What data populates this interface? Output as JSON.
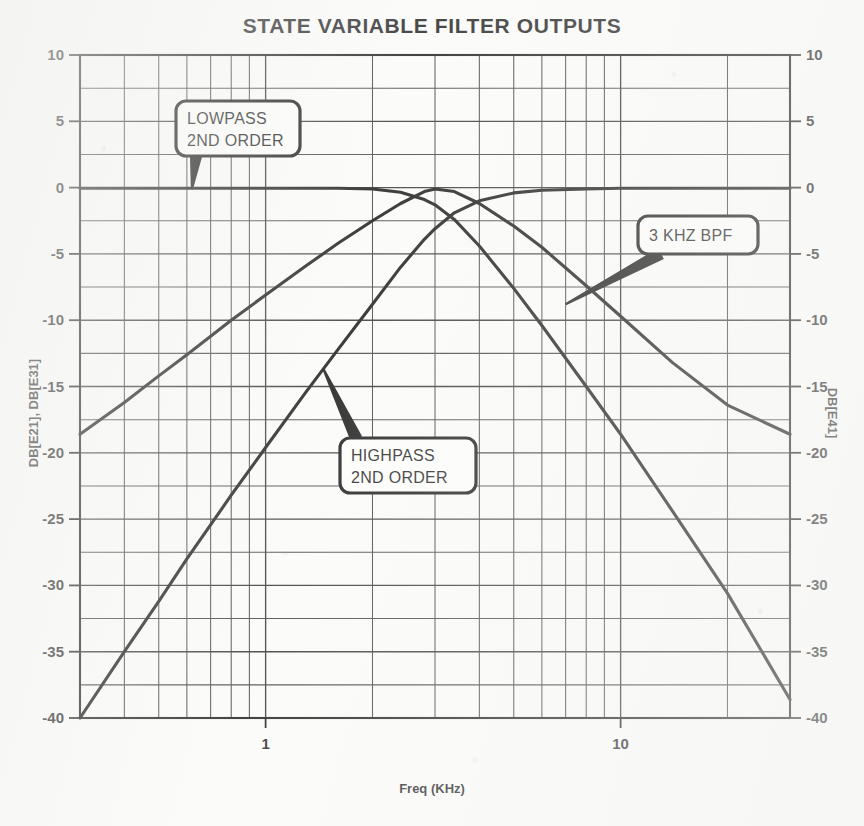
{
  "chart_data": {
    "type": "line",
    "title": "STATE VARIABLE FILTER OUTPUTS",
    "xlabel": "Freq (KHz)",
    "ylabel_left": "DB[E21], DB[E31]",
    "ylabel_right": "DB[E41]",
    "xscale": "log",
    "xlim": [
      0.3,
      30
    ],
    "ylim": [
      -40,
      10
    ],
    "ytick_labels_left": [
      "10",
      "5",
      "0",
      "-5",
      "-10",
      "-15",
      "-20",
      "-25",
      "-30",
      "-35",
      "-40"
    ],
    "ytick_values_left": [
      10,
      5,
      0,
      -5,
      -10,
      -15,
      -20,
      -25,
      -30,
      -35,
      -40
    ],
    "ytick_labels_right": [
      "10",
      "5",
      "0",
      "-5",
      "-10",
      "-15",
      "-20",
      "-25",
      "-30",
      "-35",
      "-40"
    ],
    "ytick_values_right": [
      10,
      5,
      0,
      -5,
      -10,
      -15,
      -20,
      -25,
      -30,
      -35,
      -40
    ],
    "xtick_labels": [
      "1",
      "10"
    ],
    "xtick_values": [
      1,
      10
    ],
    "grid": true,
    "grid_minor_y_step": 2.5,
    "legend": "none",
    "center_frequency_khz": 3,
    "series": [
      {
        "name": "LOWPASS 2ND ORDER",
        "trace": "DB[E21]",
        "points": [
          [
            0.3,
            -0.05
          ],
          [
            0.4,
            -0.05
          ],
          [
            0.5,
            -0.05
          ],
          [
            0.6,
            -0.05
          ],
          [
            0.8,
            -0.05
          ],
          [
            1.0,
            -0.05
          ],
          [
            1.3,
            -0.05
          ],
          [
            1.6,
            -0.05
          ],
          [
            2.0,
            -0.1
          ],
          [
            2.4,
            -0.35
          ],
          [
            2.8,
            -0.9
          ],
          [
            3.0,
            -1.3
          ],
          [
            3.4,
            -2.4
          ],
          [
            4.0,
            -4.4
          ],
          [
            5.0,
            -7.6
          ],
          [
            6.0,
            -10.4
          ],
          [
            8.0,
            -15.0
          ],
          [
            10.0,
            -18.6
          ],
          [
            14.0,
            -24.4
          ],
          [
            20.0,
            -30.6
          ],
          [
            30.0,
            -38.6
          ]
        ]
      },
      {
        "name": "HIGHPASS 2ND ORDER",
        "trace": "DB[E31]",
        "points": [
          [
            0.3,
            -40.0
          ],
          [
            0.4,
            -35.0
          ],
          [
            0.5,
            -31.2
          ],
          [
            0.6,
            -28.0
          ],
          [
            0.8,
            -23.2
          ],
          [
            1.0,
            -19.6
          ],
          [
            1.3,
            -15.4
          ],
          [
            1.6,
            -12.2
          ],
          [
            2.0,
            -8.8
          ],
          [
            2.4,
            -6.0
          ],
          [
            2.8,
            -3.9
          ],
          [
            3.0,
            -3.1
          ],
          [
            3.4,
            -1.9
          ],
          [
            4.0,
            -1.0
          ],
          [
            5.0,
            -0.4
          ],
          [
            6.0,
            -0.2
          ],
          [
            8.0,
            -0.1
          ],
          [
            10.0,
            -0.05
          ],
          [
            14.0,
            -0.05
          ],
          [
            20.0,
            -0.05
          ],
          [
            30.0,
            -0.05
          ]
        ]
      },
      {
        "name": "3 KHZ BPF",
        "trace": "DB[E41]",
        "points": [
          [
            0.3,
            -18.6
          ],
          [
            0.4,
            -16.2
          ],
          [
            0.5,
            -14.2
          ],
          [
            0.6,
            -12.6
          ],
          [
            0.8,
            -10.0
          ],
          [
            1.0,
            -8.1
          ],
          [
            1.3,
            -5.9
          ],
          [
            1.6,
            -4.2
          ],
          [
            2.0,
            -2.5
          ],
          [
            2.4,
            -1.2
          ],
          [
            2.8,
            -0.3
          ],
          [
            3.0,
            -0.1
          ],
          [
            3.4,
            -0.3
          ],
          [
            4.0,
            -1.2
          ],
          [
            5.0,
            -2.9
          ],
          [
            6.0,
            -4.5
          ],
          [
            8.0,
            -7.4
          ],
          [
            10.0,
            -9.7
          ],
          [
            14.0,
            -13.2
          ],
          [
            20.0,
            -16.4
          ],
          [
            30.0,
            -18.6
          ]
        ]
      }
    ],
    "annotations": [
      {
        "id": "lowpass",
        "lines": [
          "LOWPASS",
          "2ND ORDER"
        ],
        "target_freq_khz": 0.62,
        "target_db": -0.1
      },
      {
        "id": "highpass",
        "lines": [
          "HIGHPASS",
          "2ND ORDER"
        ],
        "target_freq_khz": 1.45,
        "target_db": -13.6
      },
      {
        "id": "bandpass",
        "lines": [
          "3 KHZ BPF"
        ],
        "target_freq_khz": 7.0,
        "target_db": -8.8
      }
    ]
  },
  "colors": {
    "ink": "#0d0d0d",
    "grid": "#2b2b2b",
    "paper": "#fbfbfa"
  }
}
